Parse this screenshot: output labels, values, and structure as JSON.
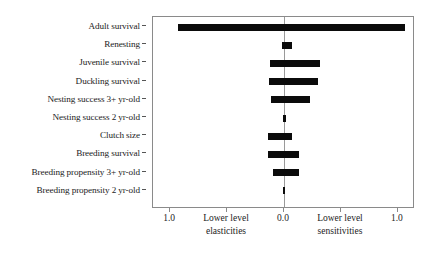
{
  "chart_data": {
    "type": "bar",
    "orientation": "horizontal",
    "title": "",
    "xlabel": "",
    "ylabel": "",
    "xlim": [
      -1.15,
      1.15
    ],
    "grid": false,
    "legend": null,
    "zero_reference_line": 0.0,
    "categories": [
      "Adult survival",
      "Renesting",
      "Juvenile survival",
      "Duckling survival",
      "Nesting success 3+ yr-old",
      "Nesting success 2 yr-old",
      "Clutch size",
      "Breeding survival",
      "Breeding propensity 3+ yr-old",
      "Breeding propensity 2 yr-old"
    ],
    "series": [
      {
        "name": "Lower level elasticities",
        "note": "values plotted left of 0.0 (negative side of axis, magnitudes)",
        "values": [
          0.93,
          0.02,
          0.12,
          0.13,
          0.11,
          0.01,
          0.14,
          0.14,
          0.1,
          0.01
        ]
      },
      {
        "name": "Lower level sensitivities",
        "note": "values plotted right of 0.0",
        "values": [
          1.06,
          0.07,
          0.32,
          0.3,
          0.23,
          0.02,
          0.07,
          0.13,
          0.13,
          0.01
        ]
      }
    ],
    "bars": [
      {
        "label": "Adult survival",
        "left": -0.93,
        "right": 1.06
      },
      {
        "label": "Renesting",
        "left": -0.02,
        "right": 0.07
      },
      {
        "label": "Juvenile survival",
        "left": -0.12,
        "right": 0.32
      },
      {
        "label": "Duckling survival",
        "left": -0.13,
        "right": 0.3
      },
      {
        "label": "Nesting success 3+ yr-old",
        "left": -0.11,
        "right": 0.23
      },
      {
        "label": "Nesting success 2 yr-old",
        "left": -0.01,
        "right": 0.02
      },
      {
        "label": "Clutch size",
        "left": -0.14,
        "right": 0.07
      },
      {
        "label": "Breeding survival",
        "left": -0.14,
        "right": 0.13
      },
      {
        "label": "Breeding propensity 3+ yr-old",
        "left": -0.1,
        "right": 0.13
      },
      {
        "label": "Breeding propensity 2 yr-old",
        "left": -0.01,
        "right": 0.01
      }
    ],
    "xticks": [
      {
        "value": -1.0,
        "label": "1.0"
      },
      {
        "value": -0.5,
        "label": ""
      },
      {
        "value": 0.0,
        "label": "0.0"
      },
      {
        "value": 0.5,
        "label": ""
      },
      {
        "value": 1.0,
        "label": "1.0"
      }
    ],
    "axis_groups": [
      {
        "center": -0.5,
        "line1": "Lower level",
        "line2": "elasticities"
      },
      {
        "center": 0.5,
        "line1": "Lower level",
        "line2": "sensitivities"
      }
    ],
    "colors": {
      "bar": "#0b0b0b",
      "frame": "#8a8a8a",
      "zero_line": "#9a9a9a",
      "text": "#1c1c1c",
      "background": "#ffffff"
    }
  }
}
